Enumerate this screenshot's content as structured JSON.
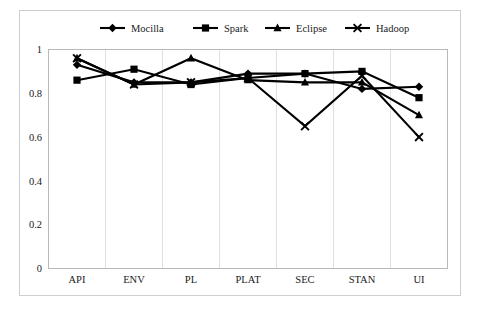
{
  "chart_data": {
    "type": "line",
    "title": "",
    "xlabel": "",
    "ylabel": "",
    "categories": [
      "API",
      "ENV",
      "PL",
      "PLAT",
      "SEC",
      "STAN",
      "UI"
    ],
    "ylim": [
      0,
      1
    ],
    "yticks": [
      "0",
      "0.2",
      "0.4",
      "0.6",
      "0.8",
      "1"
    ],
    "ytick_values": [
      0,
      0.2,
      0.4,
      0.6,
      0.8,
      1
    ],
    "grid": true,
    "grid_axis": "x",
    "legend_position": "top",
    "series": [
      {
        "name": "Mocilla",
        "marker": "diamond",
        "color": "#000000",
        "values": [
          0.93,
          0.85,
          0.85,
          0.89,
          0.89,
          0.82,
          0.83
        ]
      },
      {
        "name": "Spark",
        "marker": "square",
        "color": "#000000",
        "values": [
          0.86,
          0.91,
          0.84,
          0.87,
          0.89,
          0.9,
          0.78
        ]
      },
      {
        "name": "Eclipse",
        "marker": "triangle",
        "color": "#000000",
        "values": [
          0.96,
          0.84,
          0.96,
          0.86,
          0.85,
          0.85,
          0.7
        ]
      },
      {
        "name": "Hadoop",
        "marker": "cross",
        "color": "#000000",
        "values": [
          0.96,
          0.84,
          0.85,
          0.87,
          0.65,
          0.88,
          0.6
        ]
      }
    ]
  },
  "legend": {
    "items": [
      {
        "label": "Mocilla",
        "marker": "diamond"
      },
      {
        "label": "Spark",
        "marker": "square"
      },
      {
        "label": "Eclipse",
        "marker": "triangle"
      },
      {
        "label": "Hadoop",
        "marker": "cross"
      }
    ]
  },
  "axes": {
    "y_tick_labels": [
      "1",
      "0.8",
      "0.6",
      "0.4",
      "0.2",
      "0"
    ],
    "x_tick_labels": [
      "API",
      "ENV",
      "PL",
      "PLAT",
      "SEC",
      "STAN",
      "UI"
    ]
  }
}
